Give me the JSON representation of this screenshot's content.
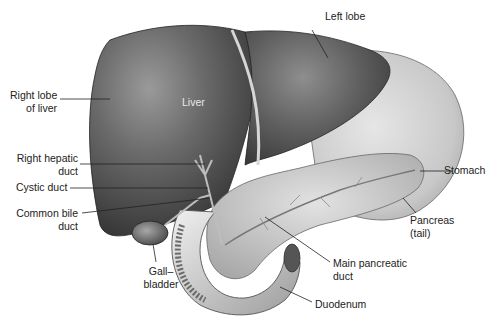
{
  "figure": {
    "labels": {
      "left_lobe": "Left lobe",
      "right_lobe_1": "Right lobe",
      "right_lobe_2": "of liver",
      "liver": "Liver",
      "right_hepatic_1": "Right hepatic",
      "right_hepatic_2": "duct",
      "cystic_duct": "Cystic duct",
      "common_bile_1": "Common bile",
      "common_bile_2": "duct",
      "stomach": "Stomach",
      "pancreas_1": "Pancreas",
      "pancreas_2": "(tail)",
      "gallbladder_1": "Gall–",
      "gallbladder_2": "bladder",
      "main_pancreatic_1": "Main pancreatic",
      "main_pancreatic_2": "duct",
      "duodenum": "Duodenum"
    }
  }
}
